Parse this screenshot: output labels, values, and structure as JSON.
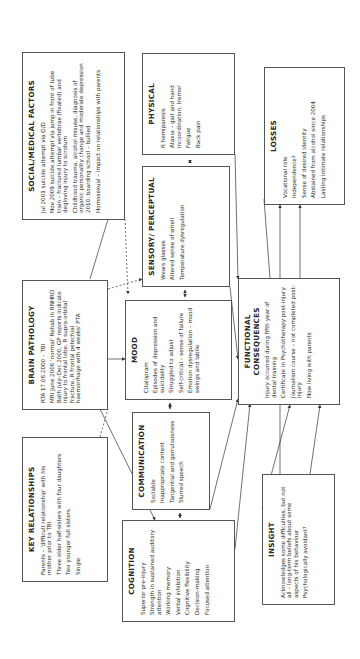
{
  "diagram": {
    "boxes": {
      "social_medical": {
        "title": "SOCIAL/MEDICAL FACTORS",
        "items": [
          "Jul 2001 suicide attempt via O/D",
          "Nov 2009 suicide attempt via jump in front of tube train – fractured lumbar vertebrae (fixated) and degloving injury to scrotum",
          "Childhood trauma, alcohol misuse, diagnosis of organic personality change and moderate depression 2010, boarding school – bullied",
          "Homosexual – impact on relationships with parents"
        ]
      },
      "brain_pathology": {
        "title": "BRAIN PATHOLOGY",
        "items": [
          "RTA 17.06.2000 – TBI",
          "MRI June 2006 'normal' Rehab in RNHRD Bath July–Dec 2000, GP reports indicate injury to frontal lobe, R supra-orbital fracture, R frontal petechial haemorrhage with 4 weeks' PTA"
        ]
      },
      "key_relationships": {
        "title": "KEY RELATIONSHIPS",
        "items": [
          "Parents – 'difficult relationship' with his mother prior to TBI",
          "Three older half-sisters with four daughters",
          "Two younger full sisters",
          "Single"
        ]
      },
      "physical": {
        "title": "PHYSICAL",
        "items": [
          "R hemiparesis",
          "Ataxia – gait and hand incoordination, tremor",
          "Fatigue",
          "Back pain"
        ]
      },
      "sensory_perceptual": {
        "title": "SENSORY/ PERCEPTUAL",
        "items": [
          "Wears glasses",
          "Altered sense of smell",
          "Temperature dysregulation"
        ]
      },
      "mood": {
        "title": "MOOD",
        "items": [
          "Citalopram",
          "Episodes of depression and suicidality",
          "Struggled to adjust",
          "Self-critical – sense of failure",
          "Emotion dysregulation – mood swings and labile"
        ]
      },
      "communication": {
        "title": "COMMUNICATION",
        "items": [
          "Sociable",
          "Inappropriate content",
          "Tangential and garrulousness",
          "Slurred speech"
        ]
      },
      "cognition": {
        "title": "COGNITION",
        "items": [
          "Superior pre-injury",
          "Strength in sustained auditory attention",
          "Working memory",
          "Verbal inhibition",
          "Cognitive flexibility",
          "Decision-making",
          "Focused attention"
        ]
      },
      "losses": {
        "title": "LOSSES",
        "items": [
          "Vocational role",
          "Independence?",
          "Sense of desired identity",
          "Abstained from alcohol since 2004",
          "Lasting intimate relationships"
        ]
      },
      "functional_consequences": {
        "title": "FUNCTIONAL CONSEQUENCES",
        "items": [
          "Injury occurred during fifth year of dental training",
          "Certificate in Psychotherapy post-injury",
          "Journalism course – not completed post-injury",
          "Now living with parents"
        ]
      },
      "insight": {
        "title": "INSIGHT",
        "items": [
          "Acknowledges some difficulties, but not all – long-term beliefs about some aspects of his behaviour",
          "Psychologically avoidant?"
        ]
      }
    },
    "colors": {
      "border": "#555555",
      "text": "#2a2a2a",
      "line": "#333333",
      "background": "#ffffff"
    },
    "orientation": "rotated -90deg"
  }
}
